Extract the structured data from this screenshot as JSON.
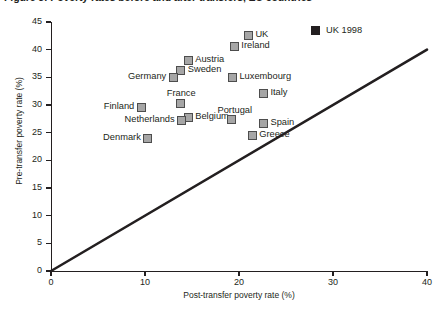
{
  "chart_data": {
    "type": "scatter",
    "title": "Figure 3: Poverty rates before and after transfers, EU countries",
    "xlabel": "Post-transfer poverty rate (%)",
    "ylabel": "Pre-transfer poverty rate (%)",
    "xlim": [
      0,
      40
    ],
    "ylim": [
      0,
      45
    ],
    "xticks": [
      0,
      10,
      20,
      30,
      40
    ],
    "yticks": [
      0,
      5,
      10,
      15,
      20,
      25,
      30,
      35,
      40,
      45
    ],
    "grid": false,
    "legend_position": "top-right",
    "legend": [
      {
        "label": "UK 1998",
        "marker": "filled-square",
        "color": "#231f20"
      }
    ],
    "reference_line": {
      "name": "45-degree-line",
      "from": [
        0,
        0
      ],
      "to": [
        40,
        40
      ],
      "color": "#231f20"
    },
    "points": [
      {
        "name": "UK",
        "x": 21.0,
        "y": 42.5,
        "label_side": "right"
      },
      {
        "name": "Ireland",
        "x": 19.5,
        "y": 40.5,
        "label_side": "right"
      },
      {
        "name": "Austria",
        "x": 14.6,
        "y": 38.0,
        "label_side": "right"
      },
      {
        "name": "Sweden",
        "x": 13.8,
        "y": 36.3,
        "label_side": "right"
      },
      {
        "name": "Germany",
        "x": 13.0,
        "y": 35.0,
        "label_side": "left"
      },
      {
        "name": "Luxembourg",
        "x": 19.3,
        "y": 35.0,
        "label_side": "right"
      },
      {
        "name": "Italy",
        "x": 22.6,
        "y": 32.0,
        "label_side": "right"
      },
      {
        "name": "France",
        "x": 13.8,
        "y": 30.3,
        "label_side": "above"
      },
      {
        "name": "Finland",
        "x": 9.6,
        "y": 29.5,
        "label_side": "left"
      },
      {
        "name": "Belgium",
        "x": 14.6,
        "y": 27.8,
        "label_side": "right"
      },
      {
        "name": "Netherlands",
        "x": 13.9,
        "y": 27.2,
        "label_side": "left"
      },
      {
        "name": "Portugal",
        "x": 19.2,
        "y": 27.3,
        "label_side": "above"
      },
      {
        "name": "Spain",
        "x": 22.6,
        "y": 26.7,
        "label_side": "right"
      },
      {
        "name": "Greece",
        "x": 21.4,
        "y": 24.5,
        "label_side": "right"
      },
      {
        "name": "Denmark",
        "x": 10.3,
        "y": 24.0,
        "label_side": "left"
      }
    ]
  },
  "axes": {
    "y_title": "Pre-transfer poverty rate (%)",
    "x_title": "Post-transfer poverty rate (%)",
    "y_tick_labels": [
      "0",
      "5",
      "10",
      "15",
      "20",
      "25",
      "30",
      "35",
      "40",
      "45"
    ],
    "x_tick_labels": [
      "0",
      "10",
      "20",
      "30",
      "40"
    ]
  },
  "legend": {
    "uk_1998_label": "UK 1998"
  },
  "title": {
    "text": "Figure 3: Poverty rates before and after transfers, EU countries"
  },
  "colors": {
    "marker_fill": "#a6a6a6",
    "marker_stroke": "#4d4d4d",
    "axis": "#231f20",
    "legend_swatch": "#231f20"
  }
}
